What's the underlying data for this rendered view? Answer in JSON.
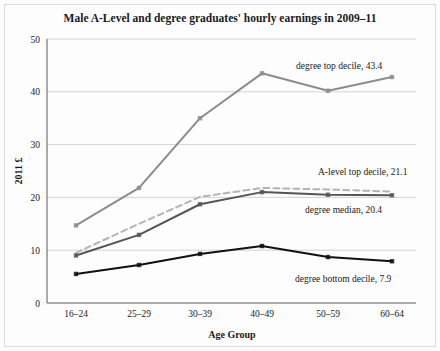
{
  "chart_data": {
    "type": "line",
    "title": "Male A-Level and degree graduates' hourly earnings in 2009–11",
    "xlabel": "Age Group",
    "ylabel": "2011 £",
    "categories": [
      "16–24",
      "25–29",
      "30–39",
      "40–49",
      "50–59",
      "60–64"
    ],
    "ylim": [
      0,
      50
    ],
    "yticks": [
      0,
      10,
      20,
      30,
      40,
      50
    ],
    "ytick_labels": [
      "0",
      "10",
      "20",
      "30",
      "40",
      "50"
    ],
    "grid": true,
    "legend_position": "inline-annotations",
    "series": [
      {
        "name": "degree top decile",
        "values": [
          14.7,
          21.8,
          35.0,
          43.5,
          40.2,
          42.8
        ],
        "color": "#8c8c8c",
        "style": "solid",
        "width": 2.0,
        "marker": true,
        "annotation": "degree top decile, 43.4"
      },
      {
        "name": "A-level top decile",
        "values": [
          9.5,
          15.0,
          20.1,
          21.8,
          21.5,
          21.1
        ],
        "color": "#b4b4b4",
        "style": "dashed",
        "width": 2.0,
        "marker": false,
        "annotation": "A-level top decile, 21.1"
      },
      {
        "name": "degree median",
        "values": [
          9.0,
          12.9,
          18.7,
          21.0,
          20.5,
          20.4
        ],
        "color": "#555555",
        "style": "solid",
        "width": 2.0,
        "marker": true,
        "annotation": "degree median, 20.4"
      },
      {
        "name": "degree bottom decile",
        "values": [
          5.5,
          7.2,
          9.3,
          10.8,
          8.7,
          7.9
        ],
        "color": "#111111",
        "style": "solid",
        "width": 2.0,
        "marker": true,
        "annotation": "degree bottom decile, 7.9"
      }
    ],
    "annotations": [
      {
        "text": "degree top decile, 43.4",
        "x": 296,
        "y": 69,
        "anchor": "start"
      },
      {
        "text": "A-level top decile, 21.1",
        "x": 318,
        "y": 175,
        "anchor": "start"
      },
      {
        "text": "degree median, 20.4",
        "x": 305,
        "y": 213,
        "anchor": "start"
      },
      {
        "text": "degree bottom decile, 7.9",
        "x": 295,
        "y": 282,
        "anchor": "start"
      }
    ]
  }
}
